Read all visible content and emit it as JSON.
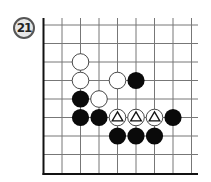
{
  "problem": {
    "number": "21"
  },
  "board": {
    "origin_x": 43.5,
    "origin_y": 25,
    "spacing": 18.5,
    "cols_visible": 9,
    "rows_visible": 9,
    "edges": [
      "left",
      "bottom"
    ],
    "line_color": "#777777",
    "edge_color": "#111111"
  },
  "stones": [
    {
      "color": "white",
      "col": 2,
      "row": 2
    },
    {
      "color": "white",
      "col": 2,
      "row": 3
    },
    {
      "color": "white",
      "col": 4,
      "row": 3
    },
    {
      "color": "black",
      "col": 5,
      "row": 3
    },
    {
      "color": "black",
      "col": 2,
      "row": 4
    },
    {
      "color": "white",
      "col": 3,
      "row": 4
    },
    {
      "color": "black",
      "col": 2,
      "row": 5
    },
    {
      "color": "black",
      "col": 3,
      "row": 5
    },
    {
      "color": "white",
      "col": 4,
      "row": 5,
      "mark": "triangle"
    },
    {
      "color": "white",
      "col": 5,
      "row": 5,
      "mark": "triangle"
    },
    {
      "color": "white",
      "col": 6,
      "row": 5,
      "mark": "triangle"
    },
    {
      "color": "black",
      "col": 7,
      "row": 5
    },
    {
      "color": "black",
      "col": 4,
      "row": 6
    },
    {
      "color": "black",
      "col": 5,
      "row": 6
    },
    {
      "color": "black",
      "col": 6,
      "row": 6
    }
  ]
}
